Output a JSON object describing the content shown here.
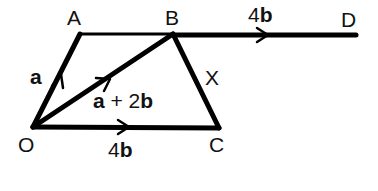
{
  "diagram": {
    "points": {
      "O": {
        "label": "O",
        "x": 33,
        "y": 127
      },
      "A": {
        "label": "A",
        "x": 80,
        "y": 34
      },
      "B": {
        "label": "B",
        "x": 173,
        "y": 34
      },
      "C": {
        "label": "C",
        "x": 219,
        "y": 128
      },
      "D": {
        "label": "D",
        "x": 356,
        "y": 35
      },
      "X": {
        "label": "X"
      }
    },
    "vectors": {
      "OA": {
        "coef": "",
        "sym": "a"
      },
      "OB": {
        "a": "a",
        "plus": " + 2",
        "b": "b"
      },
      "OC": {
        "coef": "4",
        "sym": "b"
      },
      "BD": {
        "coef": "4",
        "sym": "b"
      }
    },
    "colors": {
      "line": "#000000",
      "text": "#111111",
      "background": "#ffffff"
    }
  }
}
